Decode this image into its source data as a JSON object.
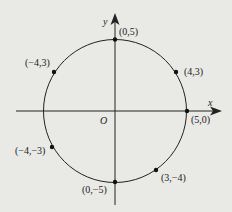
{
  "diagram": {
    "type": "circle-on-coordinate-plane",
    "circle": {
      "center": [
        0,
        0
      ],
      "radius": 5
    },
    "axes": {
      "x_label": "x",
      "y_label": "y",
      "origin_label": "O"
    },
    "points": [
      {
        "label": "(0,5)",
        "x": 0,
        "y": 5
      },
      {
        "label": "(4,3)",
        "x": 4,
        "y": 3
      },
      {
        "label": "(5,0)",
        "x": 5,
        "y": 0
      },
      {
        "label": "(3,−4)",
        "x": 3,
        "y": -4
      },
      {
        "label": "(0,−5)",
        "x": 0,
        "y": -5
      },
      {
        "label": "(−4,−3)",
        "x": -4,
        "y": -3
      },
      {
        "label": "(−4,3)",
        "x": -4,
        "y": 3
      }
    ],
    "colors": {
      "stroke": "#222222",
      "background": "#e9e9e6"
    }
  }
}
